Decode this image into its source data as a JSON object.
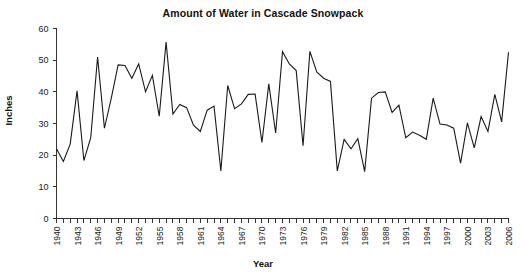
{
  "chart_data": {
    "type": "line",
    "title": "Amount of Water in Cascade Snowpack",
    "xlabel": "Year",
    "ylabel": "Inches",
    "ylim": [
      0,
      60
    ],
    "xlim": [
      1940,
      2006
    ],
    "ytick_labels": [
      "0",
      "10",
      "20",
      "30",
      "40",
      "50",
      "60"
    ],
    "yticks": [
      0,
      10,
      20,
      30,
      40,
      50,
      60
    ],
    "xtick_labels": [
      "1940",
      "1943",
      "1946",
      "1949",
      "1952",
      "1955",
      "1958",
      "1961",
      "1964",
      "1967",
      "1970",
      "1973",
      "1976",
      "1979",
      "1982",
      "1985",
      "1988",
      "1991",
      "1994",
      "1997",
      "2000",
      "2003",
      "2006"
    ],
    "xticks": [
      1940,
      1943,
      1946,
      1949,
      1952,
      1955,
      1958,
      1961,
      1964,
      1967,
      1970,
      1973,
      1976,
      1979,
      1982,
      1985,
      1988,
      1991,
      1994,
      1997,
      2000,
      2003,
      2006
    ],
    "xtick_every": 1,
    "grid": false,
    "legend": false,
    "x": [
      1940,
      1941,
      1942,
      1943,
      1944,
      1945,
      1946,
      1947,
      1948,
      1949,
      1950,
      1951,
      1952,
      1953,
      1954,
      1955,
      1956,
      1957,
      1958,
      1959,
      1960,
      1961,
      1962,
      1963,
      1964,
      1965,
      1966,
      1967,
      1968,
      1969,
      1970,
      1971,
      1972,
      1973,
      1974,
      1975,
      1976,
      1977,
      1978,
      1979,
      1980,
      1981,
      1982,
      1983,
      1984,
      1985,
      1986,
      1987,
      1988,
      1989,
      1990,
      1991,
      1992,
      1993,
      1994,
      1995,
      1996,
      1997,
      1998,
      1999,
      2000,
      2001,
      2002,
      2003,
      2004,
      2005,
      2006
    ],
    "values": [
      22.0,
      18.0,
      23.5,
      40.3,
      18.3,
      25.5,
      51.0,
      28.5,
      38.0,
      48.5,
      48.3,
      44.3,
      48.8,
      40.0,
      45.2,
      32.3,
      55.7,
      33.0,
      36.0,
      35.0,
      29.5,
      27.5,
      34.2,
      35.5,
      15.0,
      42.0,
      34.7,
      36.2,
      39.2,
      39.3,
      24.0,
      42.5,
      27.0,
      52.7,
      48.8,
      46.7,
      23.0,
      52.8,
      46.3,
      44.3,
      43.3,
      15.0,
      25.0,
      22.0,
      25.2,
      14.8,
      38.0,
      39.8,
      40.0,
      33.5,
      35.8,
      25.5,
      27.3,
      26.3,
      25.0,
      38.0,
      29.8,
      29.5,
      28.5,
      17.5,
      30.2,
      22.3,
      32.2,
      27.5,
      39.2,
      30.5,
      52.5
    ],
    "series": [
      {
        "name": "Snowpack water content",
        "color": "#1a1a1a",
        "values": [
          22.0,
          18.0,
          23.5,
          40.3,
          18.3,
          25.5,
          51.0,
          28.5,
          38.0,
          48.5,
          48.3,
          44.3,
          48.8,
          40.0,
          45.2,
          32.3,
          55.7,
          33.0,
          36.0,
          35.0,
          29.5,
          27.5,
          34.2,
          35.5,
          15.0,
          42.0,
          34.7,
          36.2,
          39.2,
          39.3,
          24.0,
          42.5,
          27.0,
          52.7,
          48.8,
          46.7,
          23.0,
          52.8,
          46.3,
          44.3,
          43.3,
          15.0,
          25.0,
          22.0,
          25.2,
          14.8,
          38.0,
          39.8,
          40.0,
          33.5,
          35.8,
          25.5,
          27.3,
          26.3,
          25.0,
          38.0,
          29.8,
          29.5,
          28.5,
          17.5,
          30.2,
          22.3,
          32.2,
          27.5,
          39.2,
          30.5,
          52.5
        ]
      }
    ],
    "tail_values": [
      16.5,
      38.5,
      22.5,
      30.2,
      14.5,
      40.5
    ],
    "tail_x": [
      2001,
      2002,
      2003,
      2004,
      2005,
      2006
    ]
  },
  "colors": {
    "line": "#1a1a1a",
    "axis": "#333333",
    "background": "#ffffff"
  }
}
